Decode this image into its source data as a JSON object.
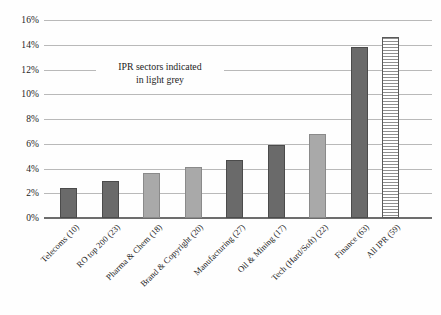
{
  "chart_data": {
    "type": "bar",
    "title": "",
    "subtitle": "",
    "xlabel": "",
    "ylabel": "",
    "ylim": [
      0,
      16
    ],
    "ytick_labels": [
      "0%",
      "2%",
      "4%",
      "6%",
      "8%",
      "10%",
      "12%",
      "14%",
      "16%"
    ],
    "ytick_values": [
      0,
      2,
      4,
      6,
      8,
      10,
      12,
      14,
      16
    ],
    "grid": true,
    "legend": false,
    "legend_position": "none",
    "value_unit": "%",
    "categories": [
      "Telecoms (10)",
      "RO top 200 (23)",
      "Pharma & Chem (18)",
      "Brand & Copyright (20)",
      "Manufacturing (27)",
      "Oil & Mining (17)",
      "Tech (Hard/Soft) (22)",
      "Finance (63)",
      "All IPR (59)"
    ],
    "values": [
      2.4,
      3.0,
      3.65,
      4.1,
      4.65,
      5.9,
      6.8,
      13.8,
      14.6
    ],
    "bar_styles": [
      "dark",
      "dark",
      "light",
      "light",
      "dark",
      "dark",
      "light",
      "dark",
      "hatched"
    ],
    "annotations": [
      {
        "line1": "IPR sectors indicated",
        "line2": "in light grey"
      }
    ],
    "colors": {
      "dark_bar": "#6a6a6a",
      "light_bar": "#a9a9a9",
      "hatched_bar_border": "#5a5a5a",
      "gridline": "#b9b9b9",
      "axis": "#6d6d6d",
      "text": "#1c1c1c",
      "background": "#fefefe"
    }
  }
}
